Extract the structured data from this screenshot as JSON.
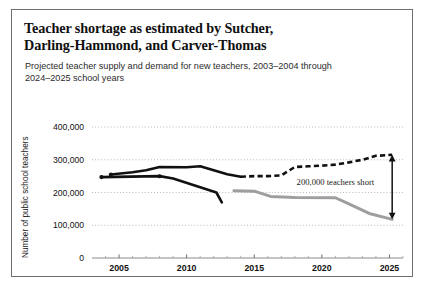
{
  "figure": {
    "title": "Teacher shortage as estimated by Sutcher, Darling-Hammond, and Carver-Thomas",
    "title_line_1": "Teacher shortage as estimated by Sutcher,",
    "title_line_2": "Darling-Hammond, and Carver-Thomas",
    "subtitle": "Projected teacher supply and demand for new teachers, 2003–2004 through 2024–2025 school years",
    "border_color": "#6e6e6e"
  },
  "chart_data": {
    "type": "line",
    "title": "Teacher shortage as estimated by Sutcher, Darling-Hammond, and Carver-Thomas",
    "subtitle": "Projected teacher supply and demand for new teachers, 2003–2004 through 2024–2025 school years",
    "xlabel": "",
    "ylabel": "Number of public school teachers",
    "xlim": [
      2003,
      2026
    ],
    "ylim": [
      0,
      400000
    ],
    "yticks": [
      0,
      100000,
      200000,
      300000,
      400000
    ],
    "ytick_labels": [
      "0",
      "100,000",
      "200,000",
      "300,000",
      "400,000"
    ],
    "xticks": [
      2005,
      2010,
      2015,
      2020,
      2025
    ],
    "xtick_labels": [
      "2005",
      "2010",
      "2015",
      "2020",
      "2025"
    ],
    "xminorticks": [
      2004,
      2006,
      2007,
      2008,
      2009,
      2011,
      2012,
      2013,
      2014,
      2016,
      2017,
      2018,
      2019,
      2021,
      2022,
      2023,
      2024,
      2026
    ],
    "grid": "horizontal-dotted",
    "legend": "none",
    "series": [
      {
        "name": "Demand (historical)",
        "style": "solid",
        "color": "#111111",
        "points": [
          {
            "x": 2004.4,
            "y": 255000
          },
          {
            "x": 2006.0,
            "y": 262000
          },
          {
            "x": 2007.0,
            "y": 268000
          },
          {
            "x": 2008.0,
            "y": 278000
          },
          {
            "x": 2010.0,
            "y": 277000
          },
          {
            "x": 2011.0,
            "y": 280000
          },
          {
            "x": 2012.0,
            "y": 268000
          },
          {
            "x": 2013.0,
            "y": 256000
          },
          {
            "x": 2014.0,
            "y": 248000
          }
        ]
      },
      {
        "name": "Demand (projected)",
        "style": "dashed",
        "color": "#111111",
        "points": [
          {
            "x": 2014.0,
            "y": 248000
          },
          {
            "x": 2015.0,
            "y": 250000
          },
          {
            "x": 2016.0,
            "y": 250000
          },
          {
            "x": 2017.0,
            "y": 252000
          },
          {
            "x": 2018.0,
            "y": 278000
          },
          {
            "x": 2019.0,
            "y": 280000
          },
          {
            "x": 2020.0,
            "y": 282000
          },
          {
            "x": 2021.0,
            "y": 285000
          },
          {
            "x": 2022.0,
            "y": 292000
          },
          {
            "x": 2023.0,
            "y": 300000
          },
          {
            "x": 2024.0,
            "y": 312000
          },
          {
            "x": 2025.2,
            "y": 315000
          }
        ]
      },
      {
        "name": "Supply (historical)",
        "style": "solid",
        "color": "#111111",
        "points": [
          {
            "x": 2003.7,
            "y": 247000
          },
          {
            "x": 2008.0,
            "y": 250000
          },
          {
            "x": 2009.0,
            "y": 243000
          },
          {
            "x": 2012.2,
            "y": 200000
          },
          {
            "x": 2012.6,
            "y": 170000
          }
        ]
      },
      {
        "name": "Supply (projected)",
        "style": "solid",
        "color": "#9e9e9e",
        "points": [
          {
            "x": 2013.5,
            "y": 205000
          },
          {
            "x": 2015.0,
            "y": 204000
          },
          {
            "x": 2016.2,
            "y": 188000
          },
          {
            "x": 2018.0,
            "y": 185000
          },
          {
            "x": 2021.0,
            "y": 184000
          },
          {
            "x": 2022.0,
            "y": 165000
          },
          {
            "x": 2023.5,
            "y": 136000
          },
          {
            "x": 2025.2,
            "y": 118000
          }
        ]
      }
    ],
    "annotations": [
      {
        "text": "200,000 teachers short",
        "x": 2021.0,
        "y": 222000,
        "arrow": {
          "type": "double-headed-vertical",
          "x": 2025.2,
          "y_top": 315000,
          "y_bottom": 118000
        }
      }
    ]
  }
}
